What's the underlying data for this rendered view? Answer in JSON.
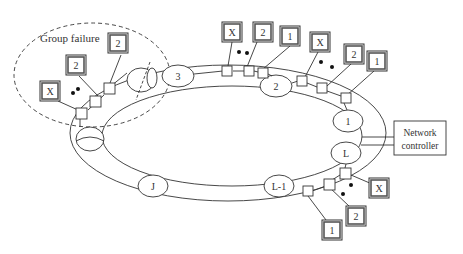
{
  "group_failure": {
    "label": "Group failure"
  },
  "ring_nodes": [
    {
      "id": "node-3",
      "label": "3",
      "cx": 178,
      "cy": 76
    },
    {
      "id": "node-2",
      "label": "2",
      "cx": 276,
      "cy": 86
    },
    {
      "id": "node-1",
      "label": "1",
      "cx": 348,
      "cy": 121
    },
    {
      "id": "node-L",
      "label": "L",
      "cx": 346,
      "cy": 152
    },
    {
      "id": "node-L-1",
      "label": "L-1",
      "cx": 279,
      "cy": 186
    },
    {
      "id": "node-J",
      "label": "J",
      "cx": 153,
      "cy": 186
    }
  ],
  "controller": {
    "label_line1": "Network",
    "label_line2": "controller"
  },
  "groups": [
    {
      "name": "group-failure-cluster",
      "boxes": [
        {
          "label": "X",
          "x": 40,
          "y": 81
        },
        {
          "label": "2",
          "x": 66,
          "y": 55
        },
        {
          "label": "2",
          "x": 108,
          "y": 33
        }
      ]
    },
    {
      "name": "group-node-3",
      "boxes": [
        {
          "label": "X",
          "x": 222,
          "y": 22
        },
        {
          "label": "2",
          "x": 253,
          "y": 22
        },
        {
          "label": "1",
          "x": 280,
          "y": 26
        }
      ]
    },
    {
      "name": "group-node-2",
      "boxes": [
        {
          "label": "X",
          "x": 310,
          "y": 32
        },
        {
          "label": "2",
          "x": 344,
          "y": 44
        },
        {
          "label": "1",
          "x": 367,
          "y": 51
        }
      ]
    },
    {
      "name": "group-node-L",
      "boxes": [
        {
          "label": "X",
          "x": 369,
          "y": 178
        },
        {
          "label": "2",
          "x": 346,
          "y": 206
        },
        {
          "label": "1",
          "x": 322,
          "y": 220
        }
      ]
    }
  ],
  "ellipsis": "•  •"
}
